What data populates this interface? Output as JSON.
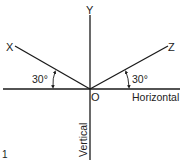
{
  "figure": {
    "number": "1",
    "axes": {
      "y_label": "Y",
      "x_label": "X",
      "z_label": "Z",
      "origin_label": "O",
      "horizontal_label": "Horizontal",
      "vertical_label": "Vertical"
    },
    "angles": {
      "left": "30°",
      "right": "30°"
    },
    "colors": {
      "line": "#1a1a1a",
      "text": "#222222",
      "background": "#ffffff"
    }
  }
}
